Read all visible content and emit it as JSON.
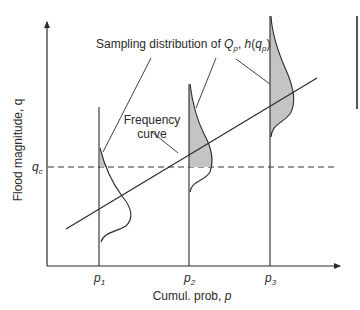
{
  "diagram": {
    "annotations": {
      "sampling_label_main": "Sampling distribution of ",
      "sampling_label_Q": "Q",
      "sampling_label_sub_p1": "p",
      "sampling_label_comma": ", ",
      "sampling_label_h": "h",
      "sampling_label_open": "(",
      "sampling_label_q": "q",
      "sampling_label_sub_p2": "p",
      "sampling_label_close": ")",
      "frequency_curve_line1": "Frequency",
      "frequency_curve_line2": "curve"
    },
    "y_axis": {
      "label": "Flood magnitude, q",
      "threshold_base": "q",
      "threshold_sub": "c"
    },
    "x_axis": {
      "label_main": "Cumul. prob, ",
      "label_var": "p",
      "ticks": [
        {
          "base": "p",
          "sub": "1"
        },
        {
          "base": "p",
          "sub": "2"
        },
        {
          "base": "p",
          "sub": "3"
        }
      ]
    },
    "colors": {
      "line": "#2a2a2a",
      "shade": "#c4c4c4",
      "dashed": "#333333"
    }
  }
}
